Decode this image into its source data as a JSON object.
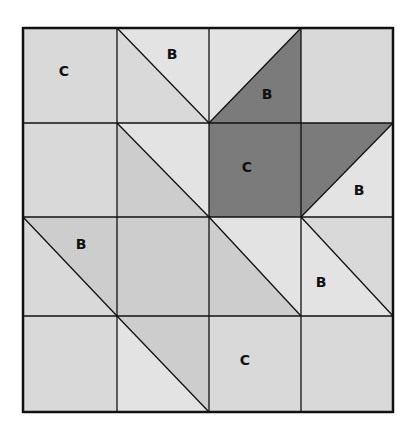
{
  "diagram": {
    "grid": {
      "cols": 4,
      "rows": 4,
      "x_edges": [
        23,
        117,
        209,
        301,
        393
      ],
      "y_edges": [
        28,
        123,
        217,
        316,
        412
      ]
    },
    "colors": {
      "light": "#e3e3e3",
      "lightgray": "#d9d9d9",
      "medium": "#cdcdcd",
      "dark": "#7b7b7b",
      "line": "#111111",
      "background": "#ffffff"
    },
    "cells": [
      {
        "col": 0,
        "row": 0,
        "type": "solid",
        "fill": "lightgray",
        "label": "C",
        "label_pos": [
          64,
          72
        ]
      },
      {
        "col": 1,
        "row": 0,
        "type": "diag-tlbr",
        "upper": "light",
        "lower": "lightgray",
        "label": "B",
        "label_pos": [
          172,
          55
        ]
      },
      {
        "col": 2,
        "row": 0,
        "type": "diag-bltr",
        "upper": "light",
        "lower": "dark",
        "label": "B",
        "label_pos": [
          267,
          95
        ]
      },
      {
        "col": 3,
        "row": 0,
        "type": "solid",
        "fill": "lightgray"
      },
      {
        "col": 0,
        "row": 1,
        "type": "solid",
        "fill": "lightgray"
      },
      {
        "col": 1,
        "row": 1,
        "type": "diag-tlbr",
        "upper": "light",
        "lower": "medium"
      },
      {
        "col": 2,
        "row": 1,
        "type": "solid",
        "fill": "dark",
        "label": "C",
        "label_pos": [
          247,
          168
        ]
      },
      {
        "col": 3,
        "row": 1,
        "type": "diag-bltr",
        "upper": "dark",
        "lower": "light",
        "label": "B",
        "label_pos": [
          359,
          191
        ]
      },
      {
        "col": 0,
        "row": 2,
        "type": "diag-tlbr",
        "upper": "medium",
        "lower": "lightgray",
        "label": "B",
        "label_pos": [
          81,
          245
        ]
      },
      {
        "col": 1,
        "row": 2,
        "type": "solid",
        "fill": "medium"
      },
      {
        "col": 2,
        "row": 2,
        "type": "diag-tlbr",
        "upper": "light",
        "lower": "medium"
      },
      {
        "col": 3,
        "row": 2,
        "type": "diag-tlbr",
        "upper": "lightgray",
        "lower": "light",
        "label": "B",
        "label_pos": [
          321,
          283
        ]
      },
      {
        "col": 0,
        "row": 3,
        "type": "solid",
        "fill": "lightgray"
      },
      {
        "col": 1,
        "row": 3,
        "type": "diag-tlbr",
        "upper": "medium",
        "lower": "light"
      },
      {
        "col": 2,
        "row": 3,
        "type": "solid",
        "fill": "lightgray",
        "label": "C",
        "label_pos": [
          245,
          361
        ]
      },
      {
        "col": 3,
        "row": 3,
        "type": "solid",
        "fill": "lightgray"
      }
    ]
  }
}
